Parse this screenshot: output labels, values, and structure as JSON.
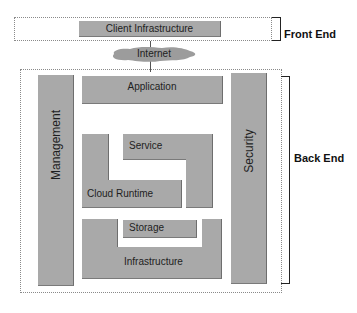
{
  "diagram": {
    "front_end": {
      "label": "Front End",
      "client_infrastructure": "Client Infrastructure"
    },
    "internet": "Internet",
    "back_end": {
      "label": "Back End",
      "management": "Management",
      "security": "Security",
      "application": "Application",
      "service": "Service",
      "cloud_runtime": "Cloud Runtime",
      "storage": "Storage",
      "infrastructure": "Infrastructure"
    },
    "colors": {
      "block_fill": "#a9a9a9",
      "cloud_fill": "#9c9c9c",
      "dashed_border": "#8a8a8a",
      "text": "#1e1e1e"
    }
  }
}
